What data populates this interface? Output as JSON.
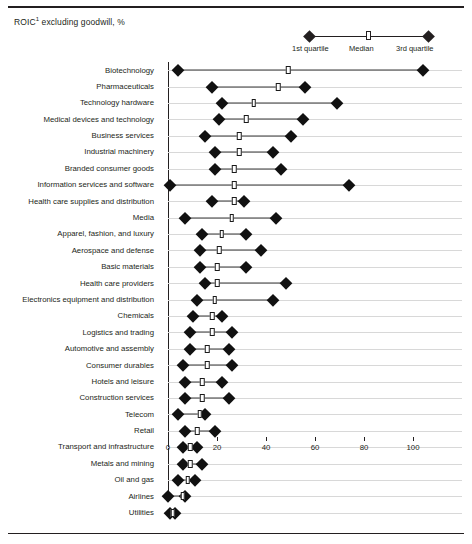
{
  "header": {
    "title": "ROIC",
    "title_superscript": "1",
    "title_rest": " excluding goodwill, %"
  },
  "legend": {
    "q1_label": "1st quartile",
    "median_label": "Median",
    "q3_label": "3rd quartile"
  },
  "axis": {
    "ticks": [
      "0",
      "20",
      "40",
      "60",
      "80",
      "100"
    ]
  },
  "chart_data": {
    "type": "bar",
    "title": "ROIC1 excluding goodwill, %",
    "xlabel": "",
    "ylabel": "",
    "xlim": [
      0,
      110
    ],
    "grid": true,
    "legend_position": "top-right",
    "legend": [
      "1st quartile",
      "Median",
      "3rd quartile"
    ],
    "series": [
      {
        "name": "1st quartile"
      },
      {
        "name": "Median"
      },
      {
        "name": "3rd quartile"
      }
    ],
    "categories": [
      "Biotechnology",
      "Pharmaceuticals",
      "Technology hardware",
      "Medical devices and technology",
      "Business services",
      "Industrial machinery",
      "Branded consumer goods",
      "Information services and software",
      "Health care supplies and distribution",
      "Media",
      "Apparel, fashion, and luxury",
      "Aerospace and defense",
      "Basic materials",
      "Health care providers",
      "Electronics equipment and distribution",
      "Chemicals",
      "Logistics and trading",
      "Automotive and assembly",
      "Consumer durables",
      "Hotels and leisure",
      "Construction services",
      "Telecom",
      "Retail",
      "Transport and infrastructure",
      "Metals and mining",
      "Oil and gas",
      "Airlines",
      "Utilities"
    ],
    "rows": [
      {
        "category": "Biotechnology",
        "q1": 4,
        "median": 49,
        "q3": 104
      },
      {
        "category": "Pharmaceuticals",
        "q1": 18,
        "median": 45,
        "q3": 56
      },
      {
        "category": "Technology hardware",
        "q1": 22,
        "median": 35,
        "q3": 69
      },
      {
        "category": "Medical devices and technology",
        "q1": 21,
        "median": 32,
        "q3": 55
      },
      {
        "category": "Business services",
        "q1": 15,
        "median": 29,
        "q3": 50
      },
      {
        "category": "Industrial machinery",
        "q1": 19,
        "median": 29,
        "q3": 43
      },
      {
        "category": "Branded consumer goods",
        "q1": 19,
        "median": 27,
        "q3": 46
      },
      {
        "category": "Information services and software",
        "q1": 1,
        "median": 27,
        "q3": 74
      },
      {
        "category": "Health care supplies and distribution",
        "q1": 18,
        "median": 27,
        "q3": 31
      },
      {
        "category": "Media",
        "q1": 7,
        "median": 26,
        "q3": 44
      },
      {
        "category": "Apparel, fashion, and luxury",
        "q1": 14,
        "median": 22,
        "q3": 32
      },
      {
        "category": "Aerospace and defense",
        "q1": 13,
        "median": 21,
        "q3": 38
      },
      {
        "category": "Basic materials",
        "q1": 13,
        "median": 20,
        "q3": 32
      },
      {
        "category": "Health care providers",
        "q1": 15,
        "median": 20,
        "q3": 48
      },
      {
        "category": "Electronics equipment and distribution",
        "q1": 12,
        "median": 19,
        "q3": 43
      },
      {
        "category": "Chemicals",
        "q1": 10,
        "median": 18,
        "q3": 22
      },
      {
        "category": "Logistics and trading",
        "q1": 9,
        "median": 18,
        "q3": 26
      },
      {
        "category": "Automotive and assembly",
        "q1": 9,
        "median": 16,
        "q3": 25
      },
      {
        "category": "Consumer durables",
        "q1": 6,
        "median": 16,
        "q3": 26
      },
      {
        "category": "Hotels and leisure",
        "q1": 7,
        "median": 14,
        "q3": 22
      },
      {
        "category": "Construction services",
        "q1": 7,
        "median": 14,
        "q3": 25
      },
      {
        "category": "Telecom",
        "q1": 4,
        "median": 13,
        "q3": 15
      },
      {
        "category": "Retail",
        "q1": 7,
        "median": 12,
        "q3": 19
      },
      {
        "category": "Transport and infrastructure",
        "q1": 6,
        "median": 9,
        "q3": 12
      },
      {
        "category": "Metals and mining",
        "q1": 6,
        "median": 9,
        "q3": 14
      },
      {
        "category": "Oil and gas",
        "q1": 4,
        "median": 8,
        "q3": 11
      },
      {
        "category": "Airlines",
        "q1": 0,
        "median": 6,
        "q3": 7
      },
      {
        "category": "Utilities",
        "q1": 1,
        "median": 2,
        "q3": 3
      }
    ]
  }
}
